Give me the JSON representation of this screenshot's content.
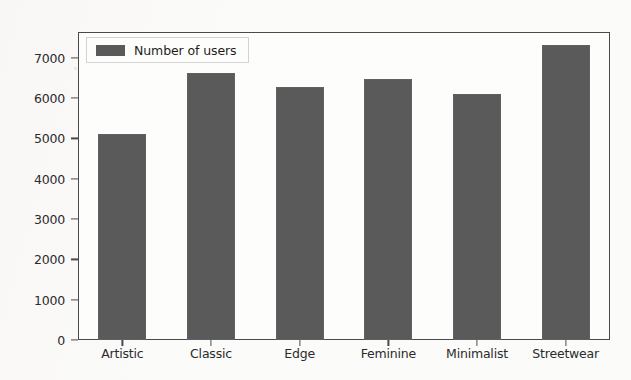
{
  "chart_data": {
    "type": "bar",
    "title": "",
    "xlabel": "",
    "ylabel": "",
    "categories": [
      "Artistic",
      "Classic",
      "Edge",
      "Feminine",
      "Minimalist",
      "Streetwear"
    ],
    "values": [
      5100,
      6620,
      6270,
      6480,
      6100,
      7320
    ],
    "series": [
      {
        "name": "Number of users",
        "values": [
          5100,
          6620,
          6270,
          6480,
          6100,
          7320
        ]
      }
    ],
    "ylim": [
      0,
      7640
    ],
    "yticks": [
      0,
      1000,
      2000,
      3000,
      4000,
      5000,
      6000,
      7000
    ],
    "ytick_labels": [
      "0",
      "1000",
      "2000",
      "3000",
      "4000",
      "5000",
      "6000",
      "7000"
    ],
    "grid": false,
    "legend": {
      "position": "upper-left",
      "entries": [
        "Number of users"
      ]
    },
    "bar_color": "#5a5a5a",
    "axes_color": "#4a4a4a",
    "background_color": "#fbfbfa"
  }
}
